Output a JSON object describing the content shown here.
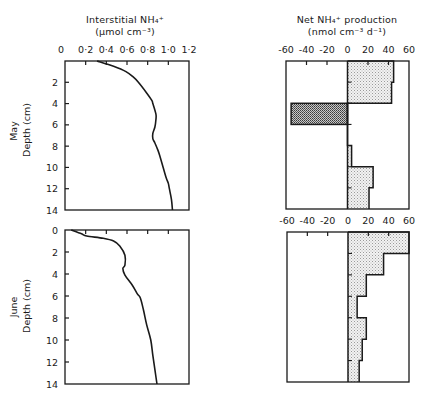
{
  "left_title": {
    "line1": "Interstitial NH₄⁺",
    "line2": "(μmol cm⁻³)"
  },
  "right_title": {
    "line1": "Net NH₄⁺ production",
    "line2": "(nmol cm⁻³ d⁻¹)"
  },
  "rows": [
    {
      "label": "May",
      "depth_label": "Depth (cm)"
    },
    {
      "label": "June",
      "depth_label": "Depth (cm)"
    }
  ],
  "colors": {
    "line": "#1a1a1a",
    "positive_fill": "#e4e4e4",
    "negative_fill": "#9a9a9a"
  },
  "chart_data": [
    {
      "type": "line",
      "title": "Interstitial NH4+ (May)",
      "xlabel": "Interstitial NH4+ (μmol cm-3)",
      "ylabel": "Depth (cm)",
      "xlim": [
        0,
        1.2
      ],
      "ylim": [
        14,
        0
      ],
      "xticks": [
        "0",
        "0·2",
        "0·4",
        "0·6",
        "0·8",
        "1·0",
        "1·2"
      ],
      "yticks": [
        "2",
        "4",
        "6",
        "8",
        "10",
        "12",
        "14"
      ],
      "depth": [
        0,
        0.5,
        1,
        1.5,
        2,
        3,
        3.7,
        4,
        5,
        5.5,
        6.2,
        6.8,
        7.3,
        7.7,
        8.4,
        9,
        10,
        11,
        11.5,
        12,
        13,
        14
      ],
      "values": [
        0.31,
        0.47,
        0.59,
        0.66,
        0.71,
        0.79,
        0.84,
        0.85,
        0.88,
        0.88,
        0.87,
        0.85,
        0.85,
        0.87,
        0.9,
        0.92,
        0.95,
        0.98,
        1.0,
        1.01,
        1.03,
        1.04
      ]
    },
    {
      "type": "bar",
      "orientation": "horizontal",
      "title": "Net NH4+ production (May)",
      "xlabel": "Net NH4+ production (nmol cm-3 d-1)",
      "ylabel": "Depth (cm)",
      "xlim": [
        -60,
        60
      ],
      "ylim": [
        14,
        0
      ],
      "xticks": [
        "-60",
        "-40",
        "-20",
        "0",
        "20",
        "40",
        "60"
      ],
      "categories": [
        "0-2",
        "2-4",
        "4-6",
        "6-8",
        "8-10",
        "10-12",
        "12-14"
      ],
      "values": [
        45,
        43,
        -55,
        0,
        4,
        25,
        21
      ]
    },
    {
      "type": "line",
      "title": "Interstitial NH4+ (June)",
      "xlabel": "Interstitial NH4+ (μmol cm-3)",
      "ylabel": "Depth (cm)",
      "xlim": [
        0,
        1.2
      ],
      "ylim": [
        14,
        0
      ],
      "yticks": [
        "0",
        "2",
        "4",
        "6",
        "8",
        "10",
        "12",
        "14"
      ],
      "depth": [
        0,
        0.35,
        0.55,
        0.75,
        1.0,
        1.45,
        2.3,
        3.2,
        3.5,
        4.1,
        5.0,
        5.8,
        6.2,
        7.3,
        8.6,
        10,
        11.4,
        12.7,
        14
      ],
      "values": [
        0.06,
        0.16,
        0.21,
        0.37,
        0.47,
        0.53,
        0.58,
        0.58,
        0.56,
        0.58,
        0.65,
        0.7,
        0.73,
        0.76,
        0.79,
        0.83,
        0.85,
        0.87,
        0.89
      ]
    },
    {
      "type": "bar",
      "orientation": "horizontal",
      "title": "Net NH4+ production (June)",
      "xlabel": "Net NH4+ production (nmol cm-3 d-1)",
      "ylabel": "Depth (cm)",
      "xlim": [
        -60,
        60
      ],
      "ylim": [
        14,
        0
      ],
      "xticks": [
        "-60",
        "-40",
        "-20",
        "0",
        "20",
        "40",
        "60"
      ],
      "categories": [
        "0-2",
        "2-4",
        "4-6",
        "6-8",
        "8-10",
        "10-12",
        "12-14"
      ],
      "values": [
        60,
        35,
        18,
        9,
        18,
        14,
        11
      ]
    }
  ]
}
